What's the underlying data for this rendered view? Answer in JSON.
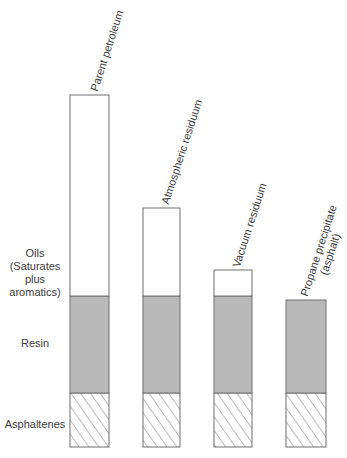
{
  "chart_data": {
    "type": "bar",
    "title": "",
    "stacked": true,
    "categories": [
      "Parent petroleum",
      "Atmospheric residuum",
      "Vacuum residuum",
      "Propane precipitate (asphalt)"
    ],
    "series": [
      {
        "name": "Asphaltenes",
        "fill": "hatched",
        "values": [
          54,
          54,
          54,
          54
        ]
      },
      {
        "name": "Resin",
        "fill": "#b9b9b9",
        "values": [
          97,
          97,
          97,
          93
        ]
      },
      {
        "name": "Oils (Saturates plus aromatics)",
        "fill": "#ffffff",
        "values": [
          201,
          88,
          26,
          0
        ]
      }
    ],
    "xlabel": "",
    "ylabel": "",
    "grid": false,
    "legend_position": "left (row labels)"
  },
  "labels": {
    "oils": [
      "Oils",
      "(Saturates",
      "plus",
      "aromatics)"
    ],
    "resin": "Resin",
    "asphaltenes": "Asphaltenes"
  },
  "bar_labels": [
    {
      "line1": "Parent petroleum",
      "line2": ""
    },
    {
      "line1": "Atmospheric residuum",
      "line2": ""
    },
    {
      "line1": "Vacuum residuum",
      "line2": ""
    },
    {
      "line1": "Propane precipitate",
      "line2": "(asphalt)"
    }
  ],
  "colors": {
    "outline": "#6e6e6e",
    "resin": "#b9b9b9",
    "oils": "#ffffff",
    "hatch": "#555555"
  }
}
